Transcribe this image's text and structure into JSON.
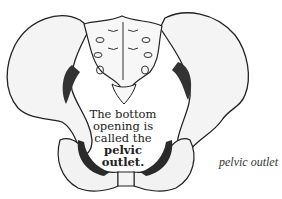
{
  "diagram": {
    "center_label": {
      "line1": "The bottom",
      "line2": "opening is",
      "line3": "called the",
      "line4_bold": "pelvic",
      "line5_bold": "outlet",
      "line5_end": "."
    },
    "caption": "pelvic outlet",
    "colors": {
      "ink": "#222222",
      "background": "#ffffff",
      "bone_fill": "#f4f4f4"
    }
  }
}
